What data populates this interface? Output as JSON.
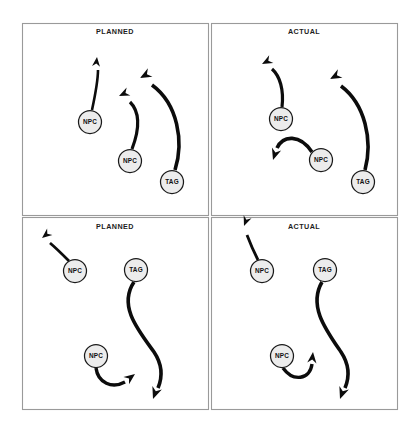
{
  "figure": {
    "background_color": "#ffffff",
    "frame_color": "#9a9a9a",
    "node_fill": "#ececec",
    "node_stroke": "#1a1a1a",
    "path_color": "#0c0c0c",
    "width": 414,
    "height": 430
  },
  "panels": [
    {
      "id": "top-left",
      "title": "PLANNED",
      "title_x": 115,
      "title_y": 34,
      "frame": {
        "x": 22.5,
        "y": 23.5,
        "w": 186,
        "h": 192
      },
      "nodes": [
        {
          "label": "NPC",
          "cx": 90,
          "cy": 122,
          "r": 11.5
        },
        {
          "label": "NPC",
          "cx": 130,
          "cy": 161,
          "r": 11.5
        },
        {
          "label": "TAG",
          "cx": 172,
          "cy": 182,
          "r": 11.5
        }
      ],
      "trajectories": [
        {
          "name": "npc-1-path",
          "d": "M 92 110 C 95 96 98 82 98 70",
          "width": 2.6,
          "head": {
            "x": 97,
            "y": 57,
            "angle": -84,
            "size": 9.5
          }
        },
        {
          "name": "npc-2-path",
          "d": "M 132 149 C 140 128 140 112 130 102",
          "width": 3.2,
          "head": {
            "x": 119,
            "y": 96,
            "angle": -205,
            "size": 10.5
          }
        },
        {
          "name": "tag-path",
          "d": "M 175 170 C 184 142 178 104 152 85",
          "width": 3.6,
          "head": {
            "x": 140,
            "y": 78,
            "angle": -208,
            "size": 11.5
          }
        }
      ]
    },
    {
      "id": "top-right",
      "title": "ACTUAL",
      "title_x": 304,
      "title_y": 34,
      "frame": {
        "x": 211.5,
        "y": 23.5,
        "w": 186,
        "h": 192
      },
      "nodes": [
        {
          "label": "NPC",
          "cx": 281,
          "cy": 119,
          "r": 11.5
        },
        {
          "label": "NPC",
          "cx": 321,
          "cy": 160,
          "r": 11.5
        },
        {
          "label": "TAG",
          "cx": 363,
          "cy": 182,
          "r": 11.5
        }
      ],
      "trajectories": [
        {
          "name": "npc-1-path",
          "d": "M 282 107 C 284 90 280 76 272 69",
          "width": 3.2,
          "head": {
            "x": 262,
            "y": 64,
            "angle": -208,
            "size": 10.5
          }
        },
        {
          "name": "npc-2-path",
          "d": "M 312 152 C 300 134 283 135 277 148",
          "width": 3.6,
          "head": {
            "x": 273,
            "y": 160,
            "angle": 108,
            "size": 11.5
          }
        },
        {
          "name": "tag-path",
          "d": "M 365 170 C 373 140 365 104 341 86",
          "width": 3.6,
          "head": {
            "x": 330,
            "y": 79,
            "angle": -208,
            "size": 11.5
          }
        }
      ]
    },
    {
      "id": "bottom-left",
      "title": "PLANNED",
      "title_x": 115,
      "title_y": 229,
      "frame": {
        "x": 22.5,
        "y": 217.5,
        "w": 186,
        "h": 192
      },
      "nodes": [
        {
          "label": "NPC",
          "cx": 75,
          "cy": 271,
          "r": 11.5
        },
        {
          "label": "TAG",
          "cx": 136,
          "cy": 270,
          "r": 11.5
        },
        {
          "label": "NPC",
          "cx": 96,
          "cy": 356,
          "r": 11.5
        }
      ],
      "trajectories": [
        {
          "name": "npc-1-path",
          "d": "M 69 261 C 62 254 56 248 50 243",
          "width": 2.8,
          "head": {
            "x": 42,
            "y": 238,
            "angle": -219,
            "size": 10
          }
        },
        {
          "name": "tag-path",
          "d": "M 134 282 C 118 306 138 330 154 352 C 162 364 163 376 158 388",
          "width": 3.6,
          "head": {
            "x": 153,
            "y": 399,
            "angle": 110,
            "size": 12
          }
        },
        {
          "name": "npc-2-path",
          "d": "M 96 368 C 98 383 112 389 125 382",
          "width": 3.4,
          "head": {
            "x": 135,
            "y": 374,
            "angle": -37,
            "size": 11
          }
        }
      ]
    },
    {
      "id": "bottom-right",
      "title": "ACTUAL",
      "title_x": 304,
      "title_y": 229,
      "frame": {
        "x": 211.5,
        "y": 217.5,
        "w": 186,
        "h": 192
      },
      "nodes": [
        {
          "label": "NPC",
          "cx": 262,
          "cy": 271,
          "r": 11.5
        },
        {
          "label": "TAG",
          "cx": 325,
          "cy": 270,
          "r": 11.5
        },
        {
          "label": "NPC",
          "cx": 282,
          "cy": 356,
          "r": 11.5
        }
      ],
      "trajectories": [
        {
          "name": "npc-1-path",
          "d": "M 258 260 C 254 252 250 243 247 235",
          "width": 2.8,
          "head": {
            "x": 244,
            "y": 226,
            "angle": -249,
            "size": 10
          }
        },
        {
          "name": "tag-path",
          "d": "M 322 282 C 308 306 326 330 341 352 C 349 364 350 376 345 388",
          "width": 3.6,
          "head": {
            "x": 340,
            "y": 399,
            "angle": 110,
            "size": 12
          }
        },
        {
          "name": "npc-2-path",
          "d": "M 283 368 C 293 382 310 380 312 364",
          "width": 3.4,
          "head": {
            "x": 313,
            "y": 352,
            "angle": -84,
            "size": 11
          }
        }
      ]
    }
  ]
}
